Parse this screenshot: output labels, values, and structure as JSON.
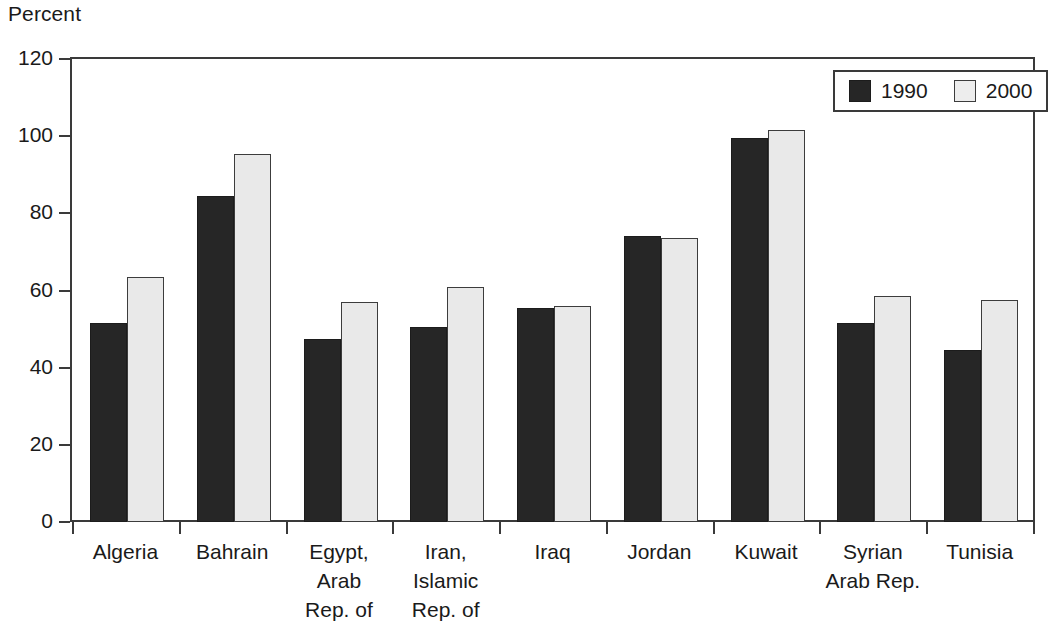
{
  "chart_data": {
    "type": "bar",
    "title": "",
    "subtitle": "",
    "xlabel": "",
    "ylabel": "Percent",
    "ylim": [
      0,
      120
    ],
    "yticks": [
      0,
      20,
      40,
      60,
      80,
      100,
      120
    ],
    "ytick_labels": [
      "0",
      "20",
      "40",
      "60",
      "80",
      "100",
      "120"
    ],
    "grid": false,
    "legend_position": "top-right",
    "categories": [
      "Algeria",
      "Bahrain",
      "Egypt,\nArab\nRep. of",
      "Iran,\nIslamic\nRep. of",
      "Iraq",
      "Jordan",
      "Kuwait",
      "Syrian\nArab Rep.",
      "Tunisia"
    ],
    "series": [
      {
        "name": "1990",
        "color": "#262626",
        "values": [
          51.5,
          84.5,
          47.5,
          50.5,
          55.5,
          74.0,
          99.5,
          51.5,
          44.5
        ]
      },
      {
        "name": "2000",
        "color": "#e9e9e9",
        "values": [
          63.5,
          95.5,
          57.0,
          61.0,
          56.0,
          73.5,
          101.5,
          58.5,
          57.5
        ]
      }
    ]
  },
  "legend": {
    "items": [
      {
        "label": "1990"
      },
      {
        "label": "2000"
      }
    ]
  }
}
